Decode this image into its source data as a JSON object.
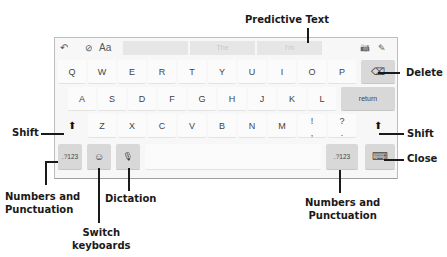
{
  "keyboard": {
    "topbar": {
      "undo_icon": "↶",
      "format_check_icon": "⊘",
      "text_format_label": "Aa",
      "predictions": [
        "",
        "The",
        "I'm"
      ],
      "camera_icon": "📷",
      "scribble_icon": "✎"
    },
    "rows": {
      "row1": [
        "Q",
        "W",
        "E",
        "R",
        "T",
        "Y",
        "U",
        "I",
        "O",
        "P"
      ],
      "row2": [
        "A",
        "S",
        "D",
        "F",
        "G",
        "H",
        "J",
        "K",
        "L"
      ],
      "row3": [
        "Z",
        "X",
        "C",
        "V",
        "B",
        "N",
        "M"
      ],
      "punct1_top": "!",
      "punct1_bottom": ",",
      "punct2_top": "?",
      "punct2_bottom": "."
    },
    "delete_icon": "⌫",
    "return_label": "return",
    "shift_icon": "⬆",
    "numbers_label": ".?123",
    "emoji_icon": "☺",
    "mic_icon": "🎙",
    "hide_keyboard_icon": "⌨"
  },
  "callouts": {
    "predictive_text": "Predictive Text",
    "delete": "Delete",
    "shift_left": "Shift",
    "shift_right": "Shift",
    "close": "Close",
    "numbers_left_line1": "Numbers and",
    "numbers_left_line2": "Punctuation",
    "dictation": "Dictation",
    "switch_line1": "Switch",
    "switch_line2": "keyboards",
    "numbers_right_line1": "Numbers and",
    "numbers_right_line2": "Punctuation"
  }
}
